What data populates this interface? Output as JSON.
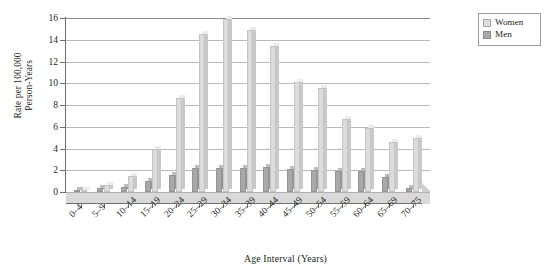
{
  "chart_data": {
    "type": "bar",
    "title": "",
    "xlabel": "Age Interval (Years)",
    "ylabel": "Rate per 100,000\nPerson-Years",
    "ylim": [
      0,
      16
    ],
    "yticks": [
      0,
      2,
      4,
      6,
      8,
      10,
      12,
      14,
      16
    ],
    "grid": true,
    "legend_position": "top-right",
    "categories": [
      "0–4",
      "5–9",
      "10–14",
      "15–19",
      "20–24",
      "25–29",
      "30–34",
      "35–39",
      "40–44",
      "45–49",
      "50–54",
      "55–59",
      "60–64",
      "65–69",
      "70–75"
    ],
    "series": [
      {
        "name": "Women",
        "color": "#dcdcdc",
        "values": [
          0.2,
          0.6,
          1.5,
          4.0,
          8.6,
          14.5,
          15.9,
          14.9,
          13.4,
          10.1,
          9.6,
          6.7,
          5.9,
          4.6,
          5.0
        ]
      },
      {
        "name": "Men",
        "color": "#a8a8a8",
        "values": [
          0.15,
          0.4,
          0.5,
          1.0,
          1.6,
          2.2,
          2.2,
          2.2,
          2.3,
          2.1,
          2.0,
          1.9,
          1.9,
          1.4,
          0.4
        ]
      }
    ]
  },
  "legend": {
    "items": [
      {
        "label": "Women",
        "swatch": "women"
      },
      {
        "label": "Men",
        "swatch": "men"
      }
    ]
  },
  "axes": {
    "y_title": "Rate per 100,000\nPerson-Years",
    "x_title": "Age Interval (Years)"
  }
}
